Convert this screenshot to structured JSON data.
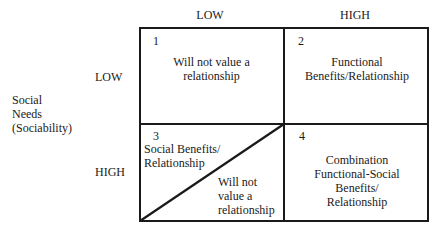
{
  "column_headers": [
    "LOW",
    "HIGH"
  ],
  "row_headers": [
    "LOW",
    "HIGH"
  ],
  "row_axis_label": [
    "Social",
    "Needs",
    "(Sociability)"
  ],
  "cells": [
    {
      "number": "1",
      "text": [
        "Will not value a",
        "relationship"
      ]
    },
    {
      "number": "2",
      "text": [
        "Functional",
        "Benefits/Relationship"
      ]
    },
    {
      "number": "3",
      "text_upper": [
        "Social Benefits/",
        "Relationship"
      ],
      "text_lower": [
        "Will not",
        "value a",
        "relationship"
      ]
    },
    {
      "number": "4",
      "text": [
        "Combination",
        "Functional-Social",
        "Benefits/",
        "Relationship"
      ]
    }
  ]
}
